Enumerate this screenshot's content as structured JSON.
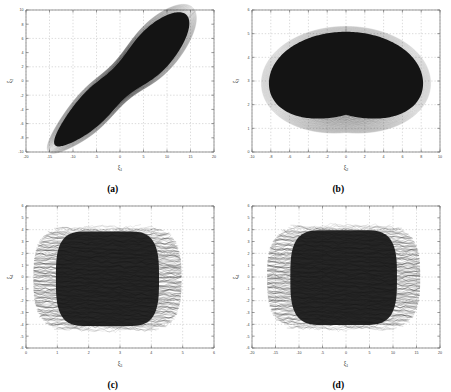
{
  "figure": {
    "panels": [
      {
        "id": "a",
        "caption": "(a)",
        "xlabel_base": "ξ",
        "xlabel_sub": "1",
        "ylabel_base": "ξ",
        "ylabel_sub": "2",
        "xlim": [
          -20,
          20
        ],
        "ylim": [
          -10,
          10
        ],
        "xticks": [
          -20,
          -15,
          -10,
          -5,
          0,
          5,
          10,
          15,
          20
        ],
        "xticklabels": [
          "-20",
          "-15",
          "-10",
          "-5",
          "0",
          "5",
          "10",
          "15",
          "20"
        ],
        "yticks": [
          -10,
          -8,
          -6,
          -4,
          -2,
          0,
          2,
          4,
          6,
          8,
          10
        ],
        "yticklabels": [
          "-10",
          "-8",
          "-6",
          "-4",
          "-2",
          "0",
          "2",
          "4",
          "6",
          "8",
          "10"
        ],
        "grid": true,
        "shape": "diagonal-elongated-ellipse"
      },
      {
        "id": "b",
        "caption": "(b)",
        "xlabel_base": "ξ",
        "xlabel_sub": "2",
        "ylabel_base": "ξ",
        "ylabel_sub": "3",
        "xlim": [
          -10,
          10
        ],
        "ylim": [
          0,
          6
        ],
        "xticks": [
          -10,
          -8,
          -6,
          -4,
          -2,
          0,
          2,
          4,
          6,
          8,
          10
        ],
        "xticklabels": [
          "-10",
          "-8",
          "-6",
          "-4",
          "-2",
          "0",
          "2",
          "4",
          "6",
          "8",
          "10"
        ],
        "yticks": [
          0,
          1,
          2,
          3,
          4,
          5,
          6
        ],
        "yticklabels": [
          "0",
          "1",
          "2",
          "3",
          "4",
          "5",
          "6"
        ],
        "grid": true,
        "shape": "heart-kidney-lobed"
      },
      {
        "id": "c",
        "caption": "(c)",
        "xlabel_base": "ξ",
        "xlabel_sub": "3",
        "ylabel_base": "ξ",
        "ylabel_sub": "4",
        "xlim": [
          0,
          6
        ],
        "ylim": [
          -6,
          6
        ],
        "xticks": [
          0,
          1,
          2,
          3,
          4,
          5,
          6
        ],
        "xticklabels": [
          "0",
          "1",
          "2",
          "3",
          "4",
          "5",
          "6"
        ],
        "yticks": [
          -6,
          -5,
          -4,
          -3,
          -2,
          -1,
          0,
          1,
          2,
          3,
          4,
          5,
          6
        ],
        "yticklabels": [
          "-6",
          "-5",
          "-4",
          "-3",
          "-2",
          "-1",
          "0",
          "1",
          "2",
          "3",
          "4",
          "5",
          "6"
        ],
        "grid": true,
        "shape": "dense-vertical-band"
      },
      {
        "id": "d",
        "caption": "(d)",
        "xlabel_base": "ξ",
        "xlabel_sub": "1",
        "ylabel_base": "ξ",
        "ylabel_sub": "4",
        "xlim": [
          -20,
          20
        ],
        "ylim": [
          -6,
          6
        ],
        "xticks": [
          -20,
          -15,
          -10,
          -5,
          0,
          5,
          10,
          15,
          20
        ],
        "xticklabels": [
          "-20",
          "-15",
          "-10",
          "-5",
          "0",
          "5",
          "10",
          "15",
          "20"
        ],
        "yticks": [
          -6,
          -5,
          -4,
          -3,
          -2,
          -1,
          0,
          1,
          2,
          3,
          4,
          5,
          6
        ],
        "yticklabels": [
          "-6",
          "-5",
          "-4",
          "-3",
          "-2",
          "-1",
          "0",
          "1",
          "2",
          "3",
          "4",
          "5",
          "6"
        ],
        "grid": true,
        "shape": "dense-vertical-band"
      }
    ]
  },
  "chart_data": [
    {
      "type": "line",
      "title": "",
      "panel": "(a)",
      "xlabel": "ξ1",
      "ylabel": "ξ2",
      "xlim": [
        -20,
        20
      ],
      "ylim": [
        -10,
        10
      ],
      "grid": true,
      "description": "Phase portrait / chaotic attractor projection, densely filled elongated region oriented along the positive diagonal",
      "attractor_extent": {
        "x_min": -18.5,
        "x_max": 18.5,
        "y_min": -9.0,
        "y_max": 8.8,
        "major_axis_angle_deg": 32
      },
      "sample_outline_x": [
        -18.5,
        -16.0,
        -11.0,
        -4.0,
        3.0,
        10.0,
        15.5,
        18.3,
        18.0,
        14.0,
        7.0,
        -1.0,
        -8.0,
        -14.0,
        -17.5,
        -18.5
      ],
      "sample_outline_y": [
        -5.0,
        -7.6,
        -8.8,
        -8.2,
        -5.0,
        -0.5,
        4.0,
        7.2,
        8.6,
        8.8,
        6.6,
        2.4,
        -1.6,
        -4.2,
        -5.4,
        -5.0
      ]
    },
    {
      "type": "line",
      "title": "",
      "panel": "(b)",
      "xlabel": "ξ2",
      "ylabel": "ξ3",
      "xlim": [
        -10,
        10
      ],
      "ylim": [
        0,
        6
      ],
      "grid": true,
      "description": "Phase portrait projection forming a heart/kidney shaped filled region with a sharp cusp notch at bottom center (x=0)",
      "attractor_extent": {
        "x_min": -9.2,
        "x_max": 9.2,
        "y_min": 0.35,
        "y_max": 5.35
      },
      "sample_outline_x": [
        0.0,
        -1.6,
        -4.5,
        -7.4,
        -9.0,
        -9.2,
        -7.8,
        -4.5,
        0.0,
        4.5,
        7.8,
        9.2,
        9.0,
        7.4,
        4.5,
        1.6,
        0.0
      ],
      "sample_outline_y": [
        0.35,
        1.05,
        1.15,
        1.7,
        2.6,
        3.7,
        4.6,
        5.2,
        5.35,
        5.2,
        4.6,
        3.7,
        2.6,
        1.7,
        1.15,
        1.05,
        0.35
      ]
    },
    {
      "type": "line",
      "title": "",
      "panel": "(c)",
      "xlabel": "ξ3",
      "ylabel": "ξ4",
      "xlim": [
        0,
        6
      ],
      "ylim": [
        -6,
        6
      ],
      "grid": true,
      "description": "Dense oscillatory trajectory filling a near-rectangular vertical band with ragged left and right edges",
      "attractor_extent": {
        "x_min": 0.45,
        "x_max": 5.2,
        "y_min": -4.5,
        "y_max": 4.2
      },
      "band": {
        "x_center": 2.6,
        "x_half_width": 2.35,
        "y_top": 4.2,
        "y_bottom": -4.5
      }
    },
    {
      "type": "line",
      "title": "",
      "panel": "(d)",
      "xlabel": "ξ1",
      "ylabel": "ξ4",
      "xlim": [
        -20,
        20
      ],
      "ylim": [
        -6,
        6
      ],
      "grid": true,
      "description": "Dense oscillatory trajectory filling a near-rectangular vertical band with ragged left and right edges",
      "attractor_extent": {
        "x_min": -16.5,
        "x_max": 16.0,
        "y_min": -4.4,
        "y_max": 4.3
      },
      "band": {
        "x_center": -0.5,
        "x_half_width": 16.2,
        "y_top": 4.3,
        "y_bottom": -4.4
      }
    }
  ]
}
